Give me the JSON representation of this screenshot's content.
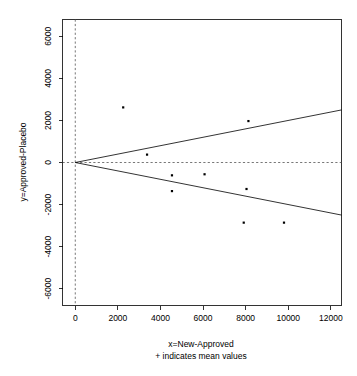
{
  "chart_data": {
    "type": "scatter",
    "title": "",
    "xlabel": "x=New-Approved",
    "xsublabel": "+ indicates mean values",
    "ylabel": "y=Approved-Placebo",
    "xlim": [
      -600,
      12500
    ],
    "ylim": [
      -6800,
      6800
    ],
    "xticks": [
      0,
      2000,
      4000,
      6000,
      8000,
      10000,
      12000
    ],
    "yticks": [
      6000,
      4000,
      2000,
      0,
      -2000,
      -4000,
      -6000
    ],
    "xtick_labels": [
      "0",
      "2000",
      "4000",
      "6000",
      "8000",
      "10000",
      "12000"
    ],
    "ytick_labels": [
      "6000",
      "4000",
      "2000",
      "0",
      "-2000",
      "-4000",
      "-6000"
    ],
    "grid": false,
    "legend": "none",
    "points": [
      {
        "x": 2250,
        "y": 2620
      },
      {
        "x": 3370,
        "y": 375
      },
      {
        "x": 4540,
        "y": -610
      },
      {
        "x": 4540,
        "y": -1360
      },
      {
        "x": 6070,
        "y": -560
      },
      {
        "x": 8130,
        "y": 1970
      },
      {
        "x": 8040,
        "y": -1260
      },
      {
        "x": 7910,
        "y": -2860
      },
      {
        "x": 9800,
        "y": -2860
      }
    ],
    "reference_lines": [
      {
        "name": "zero-horizontal",
        "style": "dashed",
        "orientation": "horizontal",
        "value": 0
      },
      {
        "name": "zero-vertical",
        "style": "dashed",
        "orientation": "vertical",
        "value": 0
      }
    ],
    "funnel_lines": [
      {
        "name": "upper-limit",
        "style": "solid",
        "from": [
          0,
          0
        ],
        "to": [
          12500,
          2500
        ]
      },
      {
        "name": "lower-limit",
        "style": "solid",
        "from": [
          0,
          0
        ],
        "to": [
          12500,
          -2500
        ]
      }
    ]
  },
  "axes": {
    "x_title": "x=New-Approved",
    "x_subtitle": "+ indicates mean values",
    "y_title": "y=Approved-Placebo"
  }
}
